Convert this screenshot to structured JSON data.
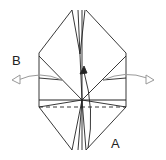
{
  "diagram": {
    "type": "origami-fold-step",
    "labels": {
      "a": "A",
      "b": "B"
    },
    "colors": {
      "line": "#222222",
      "arrow": "#999999",
      "background": "#ffffff"
    },
    "elements": [
      "outer-model-outline",
      "center-vertical-flaps",
      "horizontal-fold-line",
      "dashed-valley-fold-line",
      "fold-up-arrow-A",
      "open-left-arrow-B",
      "open-right-arrow"
    ]
  }
}
